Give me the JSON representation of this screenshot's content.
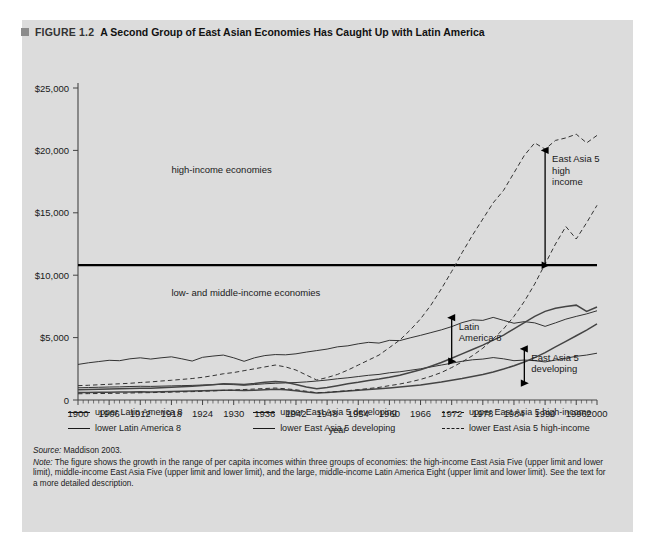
{
  "figure": {
    "marker_icon": "gray-square-icon",
    "label": "FIGURE 1.2",
    "title": "A Second Group of East Asian Economies Has Caught Up with Latin America",
    "panel_color": "#dcdcdc"
  },
  "legend": {
    "rows": [
      [
        {
          "label": "upper Latin America 8",
          "style": "solid"
        },
        {
          "label": "upper East Asia 5 developing",
          "style": "solid"
        },
        {
          "label": "upper East Asia 5 high-income",
          "style": "dashed"
        }
      ],
      [
        {
          "label": "lower Latin America 8",
          "style": "solid"
        },
        {
          "label": "lower East Asia 5 developing",
          "style": "solid"
        },
        {
          "label": "lower East Asia 5 high-income",
          "style": "dashed"
        }
      ]
    ]
  },
  "notes": {
    "source_label": "Source:",
    "source_text": " Maddison 2003.",
    "note_label": "Note:",
    "note_text": " The figure shows the growth in the range of per capita incomes within three groups of economies: the high-income East Asia Five (upper limit and lower limit), middle-income East Asia Five (upper limit and lower limit), and the large, middle-income Latin America Eight (upper limit and lower limit). See the text for a more detailed description."
  },
  "chart_data": {
    "type": "line",
    "title": "A Second Group of East Asian Economies Has Caught Up with Latin America",
    "xlabel": "year",
    "ylabel": "",
    "xlim": [
      1900,
      2000
    ],
    "ylim": [
      0,
      25000
    ],
    "grid": false,
    "legend_position": "below",
    "ytick_labels": [
      "0",
      "$5,000",
      "$10,000",
      "$15,000",
      "$20,000",
      "$25,000"
    ],
    "ytick_values": [
      0,
      5000,
      10000,
      15000,
      20000,
      25000
    ],
    "xtick_labels": [
      "1900",
      "1906",
      "1912",
      "1918",
      "1924",
      "1930",
      "1936",
      "1942",
      "1948",
      "1954",
      "1960",
      "1966",
      "1972",
      "1978",
      "1984",
      "1990",
      "1996",
      "2000"
    ],
    "xtick_values": [
      1900,
      1906,
      1912,
      1918,
      1924,
      1930,
      1936,
      1942,
      1948,
      1954,
      1960,
      1966,
      1972,
      1978,
      1984,
      1990,
      1996,
      2000
    ],
    "threshold_line": {
      "value": 10800,
      "label": "high-income threshold",
      "color": "#000000"
    },
    "region_labels": [
      {
        "text": "high-income economies",
        "x": 1918,
        "y": 18200
      },
      {
        "text": "low- and middle-income economies",
        "x": 1918,
        "y": 8300
      }
    ],
    "annotations": [
      {
        "text": "East Asia 5 high income",
        "lines": [
          "East Asia 5",
          "high",
          "income"
        ],
        "x": 1990,
        "y_top": 20000,
        "y_bottom": 10800,
        "arrow": "double-vertical"
      },
      {
        "text": "Latin America 8",
        "lines": [
          "Latin",
          "America 8"
        ],
        "x": 1972,
        "y_top": 6600,
        "y_bottom": 3100,
        "arrow": "double-vertical"
      },
      {
        "text": "East Asia 5 developing",
        "lines": [
          "East Asia 5",
          "developing"
        ],
        "x": 1986,
        "y_top": 4100,
        "y_bottom": 1350,
        "arrow": "double-vertical"
      }
    ],
    "x": [
      1900,
      1902,
      1904,
      1906,
      1908,
      1910,
      1912,
      1914,
      1916,
      1918,
      1920,
      1922,
      1924,
      1926,
      1928,
      1930,
      1932,
      1934,
      1936,
      1938,
      1940,
      1942,
      1944,
      1946,
      1948,
      1950,
      1952,
      1954,
      1956,
      1958,
      1960,
      1962,
      1964,
      1966,
      1968,
      1970,
      1972,
      1974,
      1976,
      1978,
      1980,
      1982,
      1984,
      1986,
      1988,
      1990,
      1992,
      1994,
      1996,
      1998,
      2000
    ],
    "series": [
      {
        "name": "upper Latin America 8",
        "style": "solid",
        "color": "#333333",
        "values": [
          2850,
          2980,
          3080,
          3180,
          3150,
          3300,
          3380,
          3280,
          3380,
          3460,
          3300,
          3120,
          3420,
          3520,
          3600,
          3380,
          3100,
          3380,
          3560,
          3640,
          3620,
          3700,
          3840,
          3960,
          4080,
          4260,
          4340,
          4500,
          4620,
          4560,
          4780,
          4760,
          4980,
          5180,
          5400,
          5620,
          5880,
          6200,
          6420,
          6380,
          6620,
          6380,
          6150,
          6280,
          6180,
          5900,
          6180,
          6480,
          6700,
          6900,
          7150
        ]
      },
      {
        "name": "lower Latin America 8",
        "style": "solid",
        "color": "#333333",
        "values": [
          980,
          1000,
          1020,
          1040,
          1050,
          1080,
          1100,
          1090,
          1110,
          1130,
          1150,
          1170,
          1200,
          1230,
          1260,
          1230,
          1180,
          1240,
          1300,
          1340,
          1370,
          1400,
          1450,
          1520,
          1600,
          1700,
          1780,
          1880,
          1980,
          2050,
          2180,
          2260,
          2380,
          2500,
          2650,
          2800,
          2950,
          3100,
          3220,
          3280,
          3400,
          3300,
          3150,
          3200,
          3150,
          3050,
          3200,
          3350,
          3500,
          3600,
          3750
        ]
      },
      {
        "name": "upper East Asia 5 developing",
        "style": "solid",
        "color": "#444444",
        "values": [
          820,
          840,
          860,
          880,
          900,
          930,
          950,
          940,
          980,
          1020,
          1060,
          1100,
          1160,
          1220,
          1300,
          1280,
          1240,
          1320,
          1420,
          1480,
          1420,
          1250,
          1050,
          900,
          1000,
          1150,
          1300,
          1420,
          1560,
          1680,
          1820,
          1980,
          2200,
          2420,
          2700,
          3000,
          3350,
          3700,
          4050,
          4400,
          4800,
          5200,
          5700,
          6200,
          6700,
          7100,
          7350,
          7500,
          7600,
          7100,
          7450
        ]
      },
      {
        "name": "lower East Asia 5 developing",
        "style": "solid",
        "color": "#444444",
        "values": [
          600,
          610,
          620,
          630,
          640,
          650,
          660,
          650,
          670,
          690,
          700,
          720,
          740,
          760,
          790,
          780,
          760,
          790,
          830,
          860,
          830,
          750,
          650,
          560,
          600,
          660,
          720,
          780,
          840,
          900,
          970,
          1040,
          1120,
          1210,
          1320,
          1440,
          1580,
          1720,
          1880,
          2050,
          2250,
          2480,
          2750,
          3050,
          3400,
          3800,
          4250,
          4700,
          5150,
          5600,
          6100
        ]
      },
      {
        "name": "upper East Asia 5 high-income",
        "style": "dashed",
        "color": "#333333",
        "values": [
          1150,
          1180,
          1220,
          1260,
          1300,
          1340,
          1400,
          1450,
          1520,
          1580,
          1650,
          1720,
          1820,
          1950,
          2100,
          2200,
          2350,
          2500,
          2650,
          2800,
          2650,
          2400,
          2000,
          1600,
          1800,
          2050,
          2400,
          2800,
          3200,
          3600,
          4200,
          4800,
          5600,
          6500,
          7600,
          8900,
          10300,
          11800,
          13200,
          14500,
          15800,
          16800,
          18200,
          19600,
          20600,
          20100,
          20800,
          21000,
          21300,
          20600,
          21200
        ]
      },
      {
        "name": "lower East Asia 5 high-income",
        "style": "dashed",
        "color": "#333333",
        "values": [
          500,
          510,
          520,
          530,
          540,
          560,
          580,
          590,
          610,
          630,
          650,
          670,
          700,
          730,
          770,
          800,
          840,
          880,
          920,
          960,
          900,
          820,
          700,
          580,
          620,
          680,
          750,
          830,
          920,
          1010,
          1150,
          1280,
          1450,
          1650,
          1900,
          2200,
          2600,
          3050,
          3550,
          4150,
          4900,
          5700,
          6700,
          7900,
          9300,
          10900,
          12500,
          13900,
          12900,
          14200,
          15600
        ]
      }
    ]
  }
}
